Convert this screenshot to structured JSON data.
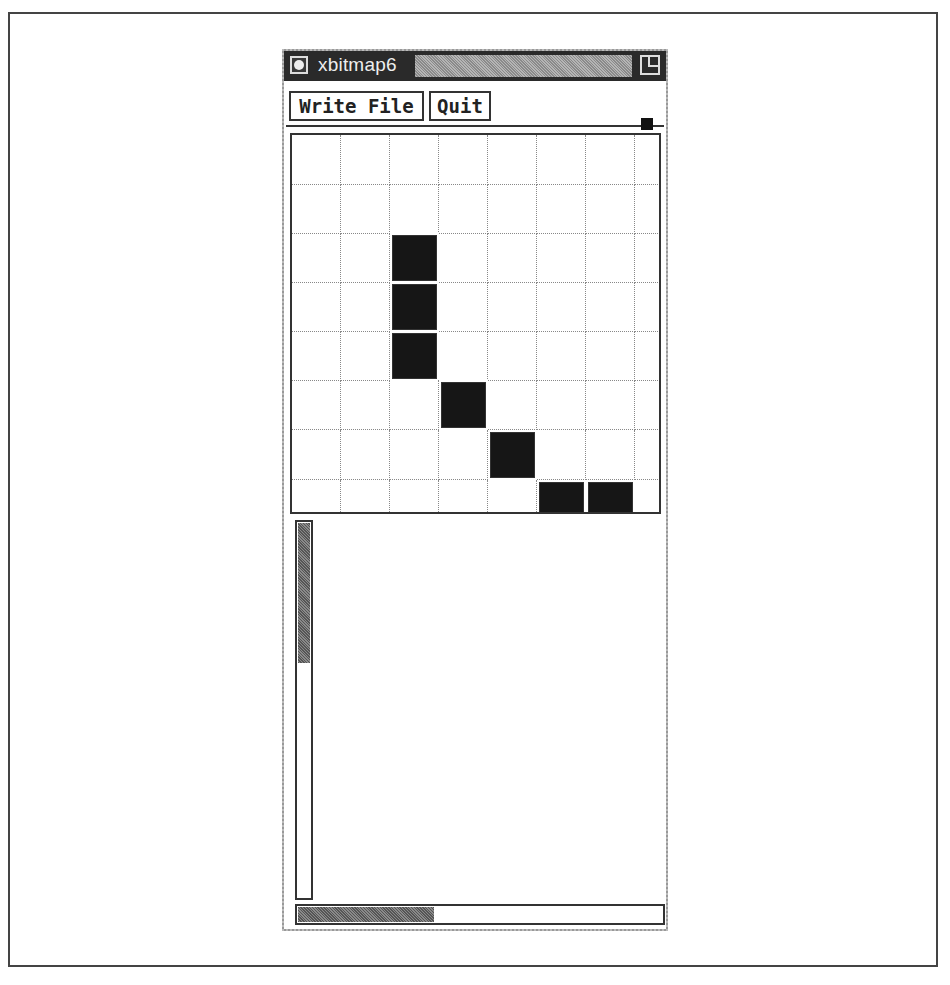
{
  "window": {
    "title": "xbitmap6",
    "title_icon": "window-menu-icon",
    "resize_icon": "resize-icon"
  },
  "toolbar": {
    "write_file_label": "Write File",
    "quit_label": "Quit"
  },
  "bitmap": {
    "visible_columns": 8,
    "visible_rows": 8,
    "cell_size_px": 49,
    "filled_cells": [
      [
        2,
        2
      ],
      [
        3,
        2
      ],
      [
        4,
        2
      ],
      [
        5,
        3
      ],
      [
        6,
        4
      ],
      [
        7,
        5
      ],
      [
        7,
        6
      ]
    ]
  },
  "scrollbars": {
    "vertical_thumb_fraction": 0.37,
    "horizontal_thumb_fraction": 0.37
  },
  "colors": {
    "titlebar": "#2a2a2a",
    "filled_cell": "#161616",
    "grid_line": "#888888"
  }
}
